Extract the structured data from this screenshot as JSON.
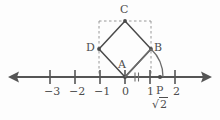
{
  "figure": {
    "kind": "number-line-geometry-construction",
    "colors": {
      "line": "#555555",
      "shape": "#4a4a4a",
      "dashed": "#8c8c8c",
      "arc": "#6b6b6b",
      "text": "#4d4d4d",
      "background": "#fdfdfd"
    },
    "axis": {
      "name": "number-line",
      "y": 77,
      "x_start": 12,
      "x_end": 208,
      "origin_x": 125,
      "unit_px": 25,
      "left_arrow": "◄",
      "right_arrow": "►",
      "ticks": [
        {
          "value": -3,
          "label": "−3",
          "x": 50
        },
        {
          "value": -2,
          "label": "−2",
          "x": 75
        },
        {
          "value": -1,
          "label": "−1",
          "x": 100
        },
        {
          "value": 0,
          "label": "0",
          "x": 125
        },
        {
          "value": 1,
          "label": "1",
          "x": 150
        },
        {
          "value": 2,
          "label": "2",
          "x": 175
        }
      ]
    },
    "square": {
      "name": "unit-square-ABCD",
      "vertices": [
        {
          "label": "A",
          "x": 125,
          "y": 77,
          "label_x": 120,
          "label_y": 62
        },
        {
          "label": "B",
          "x": 151,
          "y": 49,
          "label_x": 155,
          "label_y": 44
        },
        {
          "label": "C",
          "x": 125,
          "y": 21,
          "label_x": 121,
          "label_y": 6
        },
        {
          "label": "D",
          "x": 99,
          "y": 49,
          "label_x": 86,
          "label_y": 44
        }
      ],
      "side_length_units": 1,
      "diagonal_units": 1.41421356,
      "tick_marks_on_AB": 2
    },
    "bounding_box": {
      "name": "dashed-bounding-box",
      "left_x": 99,
      "right_x": 151,
      "top_y": 21,
      "bottom_y": 77
    },
    "arc": {
      "name": "compass-arc",
      "from": "B",
      "to": "P",
      "center_x": 125,
      "center_y": 77,
      "radius": 38
    },
    "point_p": {
      "label": "P",
      "x": 160,
      "y": 77,
      "label_x": 156,
      "label_y": 82,
      "value_label": "2",
      "radical_symbol": "√",
      "value_x": 153,
      "value_y": 98
    }
  }
}
